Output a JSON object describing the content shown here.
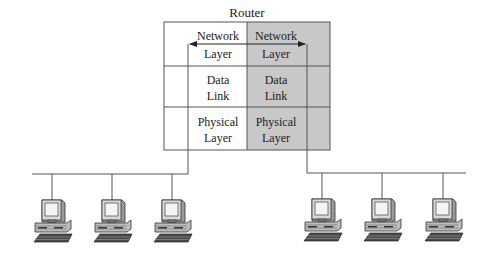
{
  "title": "Router",
  "colors": {
    "line": "#555555",
    "gray_fill": "#c8c8c8",
    "white_fill": "#ffffff",
    "text": "#222222"
  },
  "router": {
    "columns": [
      {
        "side": "left",
        "shaded": false,
        "layers": [
          {
            "line1": "Network",
            "line2": "Layer"
          },
          {
            "line1": "Data",
            "line2": "Link"
          },
          {
            "line1": "Physical",
            "line2": "Layer"
          }
        ]
      },
      {
        "side": "right",
        "shaded": true,
        "layers": [
          {
            "line1": "Network",
            "line2": "Layer"
          },
          {
            "line1": "Data",
            "line2": "Link"
          },
          {
            "line1": "Physical",
            "line2": "Layer"
          }
        ]
      }
    ],
    "arrow": {
      "type": "double-headed",
      "between": "network-layers"
    }
  },
  "networks": [
    {
      "side": "left",
      "computers": 3
    },
    {
      "side": "right",
      "computers": 3
    }
  ]
}
